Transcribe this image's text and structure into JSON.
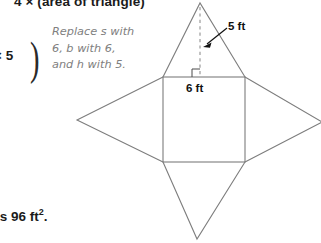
{
  "worksheet": {
    "formula_line": "4 × (area of triangle)",
    "multiplier_fragment": "× 5",
    "paren_glyph": ")",
    "result_prefix": "is 96 ft",
    "result_exponent": "2",
    "result_suffix": ".",
    "note": "Replace s with\n6, b with 6,\nand h with 5."
  },
  "figure": {
    "caption_height": "5 ft",
    "caption_base": "6 ft",
    "line_color": "#7d7d7d",
    "dashed_color": "#9a9a9a",
    "arrow_color": "#111111",
    "geometry": {
      "square": {
        "left": 163,
        "top": 77,
        "right": 245,
        "bottom": 162
      },
      "apex_top": {
        "x": 200,
        "y": 3
      },
      "apex_left": {
        "x": 77,
        "y": 120
      },
      "apex_right": {
        "x": 322,
        "y": 122
      },
      "apex_bottom": {
        "x": 197,
        "y": 239
      },
      "altitude": {
        "x": 200,
        "y_top": 7,
        "y_bottom": 77
      },
      "right_angle_marker": {
        "x": 192,
        "y": 69,
        "size": 8
      },
      "arrow": {
        "from_x": 227,
        "from_y": 28,
        "to_x": 204,
        "to_y": 46
      }
    }
  }
}
